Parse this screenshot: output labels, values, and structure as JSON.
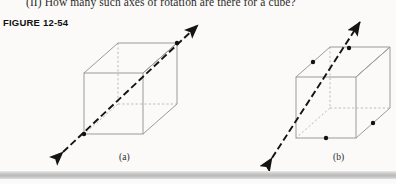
{
  "page": {
    "background_color": "#fbfaf8",
    "question_text": "(II) How many such axes of rotation are there for a cube?",
    "figure_label": "FIGURE 12-54"
  },
  "figures": [
    {
      "id": "a",
      "caption": "(a)",
      "description": "Cube with rotation axis along a body diagonal through two opposite vertices",
      "axis_type": "body-diagonal",
      "marker_count": 2,
      "arrowheads": 2
    },
    {
      "id": "b",
      "caption": "(b)",
      "description": "Cube with rotation axis through the midpoints of two opposite edges",
      "axis_type": "edge-midpoint",
      "marker_count": 4,
      "arrowheads": 2
    }
  ],
  "colors": {
    "cube_edge": "#9a9a9a",
    "hidden_edge": "#b0b0b0",
    "axis": "#141414",
    "text": "#2b2b2b",
    "bar": "#c6c6c6"
  }
}
